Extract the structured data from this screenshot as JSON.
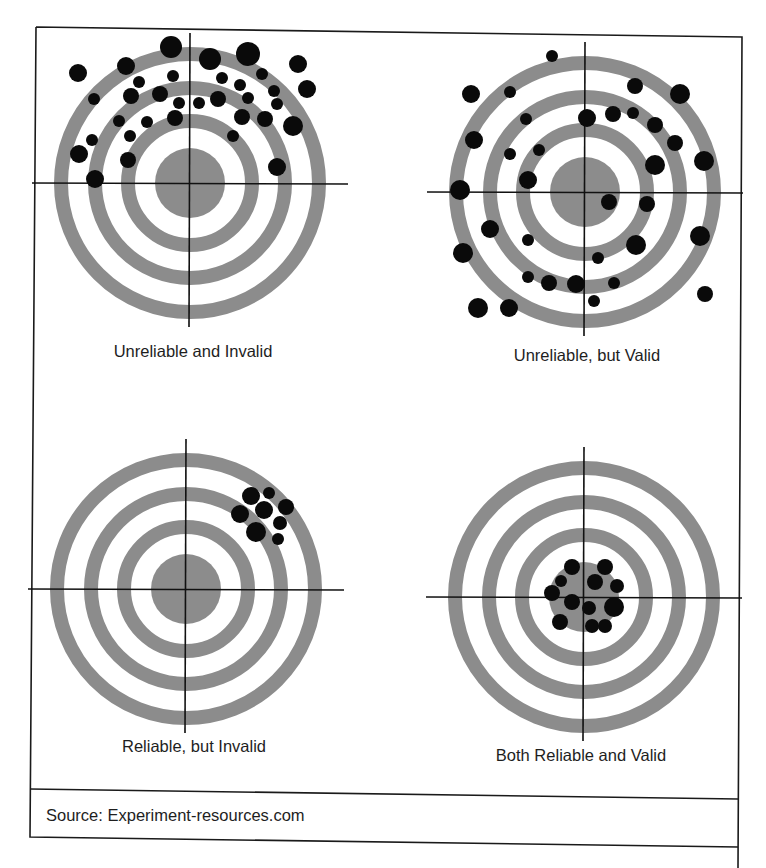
{
  "figure": {
    "source_text": "Source: Experiment-resources.com",
    "colors": {
      "ring": "#8c8c8c",
      "dot": "#0a0a0a",
      "line": "#111111",
      "background": "#ffffff"
    },
    "ring_style": {
      "outer_r": 129,
      "mid_r": 95,
      "inner_r": 62,
      "ring_width": 14,
      "bull_r": 35,
      "cross_half": 158
    }
  },
  "targets": [
    {
      "id": "unreliable-invalid",
      "label": "Unreliable and Invalid",
      "center": [
        190,
        183
      ],
      "label_pos": [
        193,
        357
      ],
      "dots": [
        [
          78,
          73,
          9
        ],
        [
          171,
          47,
          11
        ],
        [
          126,
          66,
          9
        ],
        [
          210,
          59,
          11
        ],
        [
          248,
          54,
          12
        ],
        [
          298,
          64,
          9
        ],
        [
          307,
          89,
          9
        ],
        [
          173,
          76,
          6
        ],
        [
          139,
          82,
          6
        ],
        [
          222,
          78,
          6
        ],
        [
          240,
          85,
          6
        ],
        [
          262,
          74,
          6
        ],
        [
          94,
          99,
          6
        ],
        [
          131,
          96,
          8
        ],
        [
          160,
          94,
          8
        ],
        [
          179,
          103,
          6
        ],
        [
          199,
          103,
          6
        ],
        [
          218,
          99,
          8
        ],
        [
          248,
          98,
          6
        ],
        [
          274,
          91,
          6
        ],
        [
          277,
          104,
          6
        ],
        [
          119,
          121,
          6
        ],
        [
          147,
          122,
          6
        ],
        [
          175,
          118,
          8
        ],
        [
          242,
          117,
          8
        ],
        [
          265,
          119,
          8
        ],
        [
          293,
          126,
          10
        ],
        [
          92,
          140,
          6
        ],
        [
          130,
          136,
          6
        ],
        [
          233,
          136,
          6
        ],
        [
          79,
          154,
          9
        ],
        [
          128,
          160,
          8
        ],
        [
          277,
          167,
          9
        ],
        [
          95,
          179,
          9
        ]
      ]
    },
    {
      "id": "unreliable-valid",
      "label": "Unreliable, but Valid",
      "center": [
        585,
        192
      ],
      "label_pos": [
        587,
        361
      ],
      "dots": [
        [
          552,
          56,
          6
        ],
        [
          471,
          94,
          9
        ],
        [
          510,
          92,
          6
        ],
        [
          635,
          86,
          8
        ],
        [
          680,
          94,
          10
        ],
        [
          526,
          119,
          6
        ],
        [
          587,
          118,
          9
        ],
        [
          613,
          114,
          8
        ],
        [
          633,
          113,
          6
        ],
        [
          655,
          125,
          8
        ],
        [
          474,
          140,
          9
        ],
        [
          510,
          154,
          6
        ],
        [
          539,
          150,
          6
        ],
        [
          675,
          143,
          8
        ],
        [
          655,
          165,
          10
        ],
        [
          704,
          161,
          10
        ],
        [
          528,
          180,
          9
        ],
        [
          460,
          190,
          10
        ],
        [
          609,
          202,
          8
        ],
        [
          647,
          204,
          8
        ],
        [
          490,
          229,
          9
        ],
        [
          528,
          240,
          6
        ],
        [
          636,
          245,
          10
        ],
        [
          700,
          236,
          10
        ],
        [
          463,
          253,
          10
        ],
        [
          598,
          258,
          6
        ],
        [
          528,
          277,
          6
        ],
        [
          549,
          283,
          8
        ],
        [
          576,
          284,
          9
        ],
        [
          614,
          283,
          6
        ],
        [
          594,
          301,
          6
        ],
        [
          705,
          294,
          8
        ],
        [
          478,
          308,
          10
        ],
        [
          509,
          308,
          9
        ]
      ]
    },
    {
      "id": "reliable-invalid",
      "label": "Reliable, but Invalid",
      "center": [
        186,
        589
      ],
      "label_pos": [
        194,
        752
      ],
      "dots": [
        [
          251,
          496,
          9
        ],
        [
          269,
          493,
          6
        ],
        [
          286,
          507,
          8
        ],
        [
          264,
          510,
          9
        ],
        [
          240,
          514,
          9
        ],
        [
          280,
          523,
          7
        ],
        [
          256,
          532,
          10
        ],
        [
          278,
          539,
          6
        ]
      ]
    },
    {
      "id": "reliable-valid",
      "label": "Both Reliable and Valid",
      "center": [
        584,
        597
      ],
      "label_pos": [
        581,
        761
      ],
      "dots": [
        [
          572,
          567,
          8
        ],
        [
          605,
          567,
          8
        ],
        [
          561,
          581,
          6
        ],
        [
          595,
          582,
          8
        ],
        [
          617,
          586,
          7
        ],
        [
          552,
          593,
          8
        ],
        [
          572,
          602,
          8
        ],
        [
          589,
          608,
          7
        ],
        [
          614,
          607,
          10
        ],
        [
          560,
          622,
          8
        ],
        [
          592,
          626,
          7
        ],
        [
          605,
          626,
          7
        ]
      ]
    }
  ]
}
